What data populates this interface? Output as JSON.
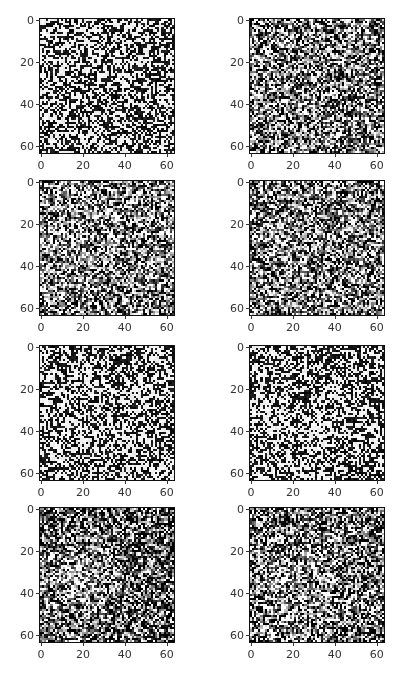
{
  "figure": {
    "layout": {
      "rows": 4,
      "cols": 2
    },
    "tick_labels": [
      "0",
      "20",
      "40",
      "60"
    ],
    "tick_values": [
      0,
      20,
      40,
      60
    ],
    "image_size": 64
  },
  "chart_data": {
    "type": "heatmap",
    "title": "",
    "xlim": [
      0,
      63
    ],
    "ylim": [
      63,
      0
    ],
    "xticks": [
      0,
      20,
      40,
      60
    ],
    "yticks": [
      0,
      20,
      40,
      60
    ],
    "colormap": "gray",
    "panels": [
      {
        "row": 0,
        "col": 0,
        "style": "high-contrast binary noise",
        "contrast": 1.0,
        "blob": null
      },
      {
        "row": 0,
        "col": 1,
        "style": "grayscale noise",
        "contrast": 0.75,
        "blob": null
      },
      {
        "row": 1,
        "col": 0,
        "style": "grayscale noise, faint bright region",
        "contrast": 0.7,
        "blob": {
          "x": 18,
          "y": 30,
          "r": 16,
          "strength": 0.15
        }
      },
      {
        "row": 1,
        "col": 1,
        "style": "grayscale noise",
        "contrast": 0.65,
        "blob": null
      },
      {
        "row": 2,
        "col": 0,
        "style": "high-contrast noise, bright region",
        "contrast": 1.0,
        "blob": {
          "x": 18,
          "y": 36,
          "r": 14,
          "strength": 0.2
        }
      },
      {
        "row": 2,
        "col": 1,
        "style": "high-contrast noise, bright region",
        "contrast": 1.0,
        "blob": {
          "x": 20,
          "y": 40,
          "r": 14,
          "strength": 0.2
        }
      },
      {
        "row": 3,
        "col": 0,
        "style": "dark noise with bright blob",
        "contrast": 0.7,
        "blob": {
          "x": 16,
          "y": 32,
          "r": 16,
          "strength": 0.35
        },
        "bias": -0.2
      },
      {
        "row": 3,
        "col": 1,
        "style": "dark noise with bright blob",
        "contrast": 0.85,
        "blob": {
          "x": 22,
          "y": 34,
          "r": 16,
          "strength": 0.3
        },
        "bias": -0.12
      }
    ]
  }
}
